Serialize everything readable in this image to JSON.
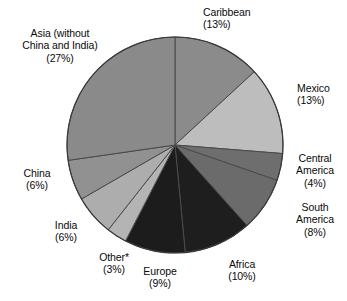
{
  "chart_data": {
    "type": "pie",
    "title": "",
    "subtitle": "",
    "xlabel": "",
    "ylabel": "",
    "grid": false,
    "legend_position": "none",
    "labels_placement": "outside-callout-free",
    "start_angle_deg": -90,
    "direction": "clockwise",
    "units": "percent",
    "total": 100,
    "categories": [
      "Caribbean",
      "Mexico",
      "Central America",
      "South America",
      "Africa",
      "Europe",
      "Other*",
      "India",
      "China",
      "Asia (without China and India)"
    ],
    "values": [
      13,
      13,
      4,
      8,
      10,
      9,
      3,
      6,
      6,
      27
    ],
    "slices": [
      {
        "name": "Caribbean",
        "value": 13,
        "value_text": "(13%)",
        "color": "#8b8b8b"
      },
      {
        "name": "Mexico",
        "value": 13,
        "value_text": "(13%)",
        "color": "#bdbdbd"
      },
      {
        "name": "Central America",
        "value": 4,
        "value_text": "(4%)",
        "color": "#6e6e6e"
      },
      {
        "name": "South America",
        "value": 8,
        "value_text": "(8%)",
        "color": "#6b6b6b"
      },
      {
        "name": "Africa",
        "value": 10,
        "value_text": "(10%)",
        "color": "#1e1e1e"
      },
      {
        "name": "Europe",
        "value": 9,
        "value_text": "(9%)",
        "color": "#1c1c1c"
      },
      {
        "name": "Other*",
        "value": 3,
        "value_text": "(3%)",
        "color": "#b4b4b4"
      },
      {
        "name": "India",
        "value": 6,
        "value_text": "(6%)",
        "color": "#adadad"
      },
      {
        "name": "China",
        "value": 6,
        "value_text": "(6%)",
        "color": "#919191"
      },
      {
        "name": "Asia (without China and India)",
        "value": 27,
        "value_text": "(27%)",
        "color": "#8a8a8a"
      }
    ]
  },
  "labels": {
    "caribbean": {
      "line1": "Caribbean",
      "line2": "(13%)"
    },
    "asia": {
      "line1": "Asia (without",
      "line2": "China and India)",
      "line3": "(27%)"
    },
    "mexico": {
      "line1": "Mexico",
      "line2": "(13%)"
    },
    "central_america": {
      "line1": "Central",
      "line2": "America",
      "line3": "(4%)"
    },
    "south_america": {
      "line1": "South",
      "line2": "America",
      "line3": "(8%)"
    },
    "africa": {
      "line1": "Africa",
      "line2": "(10%)"
    },
    "europe": {
      "line1": "Europe",
      "line2": "(9%)"
    },
    "other": {
      "line1": "Other*",
      "line2": "(3%)"
    },
    "india": {
      "line1": "India",
      "line2": "(6%)"
    },
    "china": {
      "line1": "China",
      "line2": "(6%)"
    }
  },
  "geometry": {
    "center_x": 175,
    "center_y": 145,
    "radius": 108,
    "outline_color": "#3a3a3a",
    "separator_color": "#4a4a4a"
  }
}
